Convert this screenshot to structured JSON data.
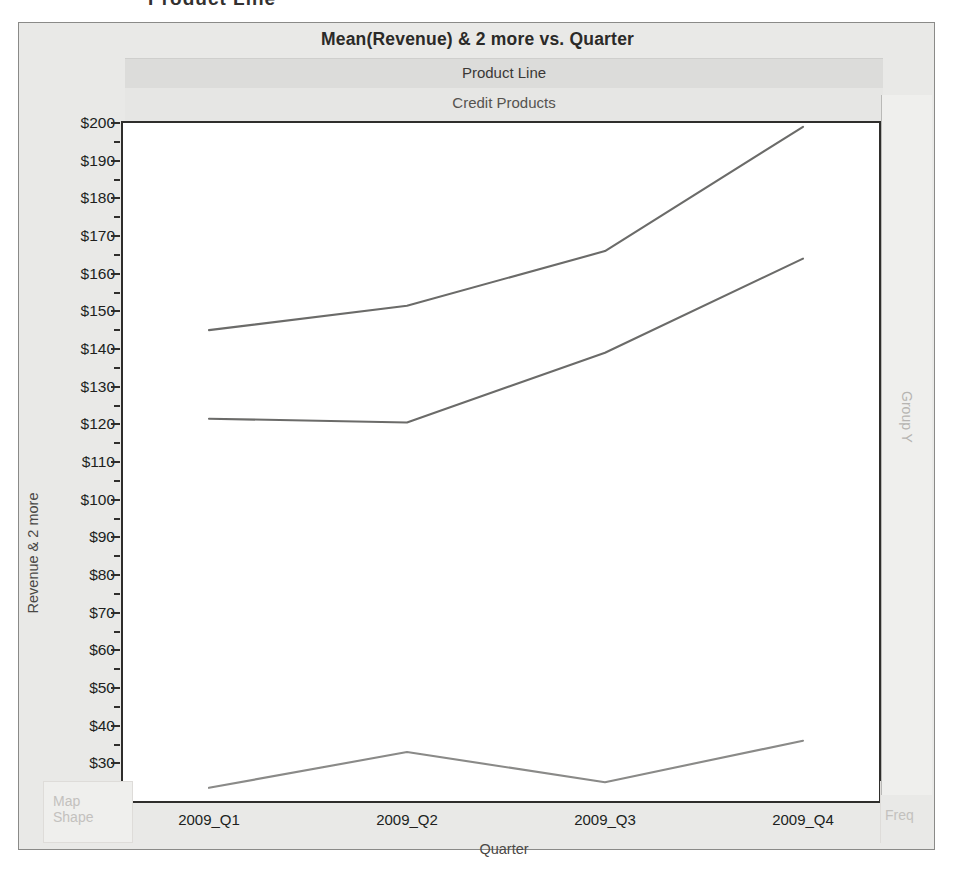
{
  "top_caption": "Product Line",
  "chart_frame": {
    "title": "Mean(Revenue) & 2 more vs. Quarter",
    "group_header": "Product Line",
    "group_value": "Credit Products",
    "right_strip_label": "Group Y",
    "map_shape": {
      "line1": "Map",
      "line2": "Shape"
    },
    "freq_label": "Freq"
  },
  "chart_data": {
    "type": "line",
    "title": "Mean(Revenue) & 2 more vs. Quarter",
    "panel_header": "Product Line",
    "panel_value": "Credit Products",
    "xlabel": "Quarter",
    "ylabel": "Revenue & 2 more",
    "categories": [
      "2009_Q1",
      "2009_Q2",
      "2009_Q3",
      "2009_Q4"
    ],
    "ylim": [
      20,
      200
    ],
    "ytick_step": 10,
    "yticks": [
      "$20",
      "$30",
      "$40",
      "$50",
      "$60",
      "$70",
      "$80",
      "$90",
      "$100",
      "$110",
      "$120",
      "$130",
      "$140",
      "$150",
      "$160",
      "$170",
      "$180",
      "$190",
      "$200"
    ],
    "ytick_values": [
      20,
      30,
      40,
      50,
      60,
      70,
      80,
      90,
      100,
      110,
      120,
      130,
      140,
      150,
      160,
      170,
      180,
      190,
      200
    ],
    "grid": false,
    "legend": "none",
    "minor_ticks": true,
    "series": [
      {
        "name": "Series 1",
        "color": "#6b6b69",
        "values": [
          145.0,
          151.5,
          166.0,
          199.0
        ]
      },
      {
        "name": "Series 2",
        "color": "#6b6b69",
        "values": [
          121.5,
          120.5,
          139.0,
          164.0
        ]
      },
      {
        "name": "Series 3",
        "color": "#8a8a88",
        "values": [
          23.5,
          33.0,
          25.0,
          36.0
        ]
      }
    ]
  }
}
